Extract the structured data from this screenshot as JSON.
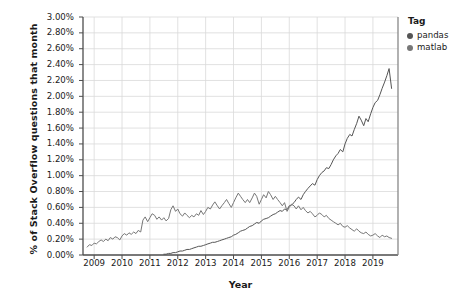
{
  "chart_data": {
    "type": "line",
    "title": "",
    "xlabel": "Year",
    "ylabel": "% of Stack Overflow questions that month",
    "xlim": [
      2008.6,
      2019.9
    ],
    "ylim": [
      0,
      3.0
    ],
    "grid": true,
    "legend_position": "right",
    "legend_title": "Tag",
    "y_tick_labels": [
      "0.00%",
      "0.20%",
      "0.40%",
      "0.60%",
      "0.80%",
      "1.00%",
      "1.20%",
      "1.40%",
      "1.60%",
      "1.80%",
      "2.00%",
      "2.20%",
      "2.40%",
      "2.60%",
      "2.80%",
      "3.00%"
    ],
    "y_tick_values": [
      0.0,
      0.2,
      0.4,
      0.6,
      0.8,
      1.0,
      1.2,
      1.4,
      1.6,
      1.8,
      2.0,
      2.2,
      2.4,
      2.6,
      2.8,
      3.0
    ],
    "x_tick_labels": [
      "2009",
      "2010",
      "2011",
      "2012",
      "2013",
      "2014",
      "2015",
      "2016",
      "2017",
      "2018",
      "2019"
    ],
    "x_tick_values": [
      2009,
      2010,
      2011,
      2012,
      2013,
      2014,
      2015,
      2016,
      2017,
      2018,
      2019
    ],
    "colors": {
      "pandas": "#555555",
      "matlab": "#777777",
      "grid": "#d9d9d9",
      "axis": "#4d4d4d"
    },
    "series": [
      {
        "name": "pandas",
        "color": "#555555",
        "x": [
          2011.5,
          2011.58,
          2011.67,
          2011.75,
          2011.83,
          2011.92,
          2012.0,
          2012.08,
          2012.17,
          2012.25,
          2012.33,
          2012.42,
          2012.5,
          2012.58,
          2012.67,
          2012.75,
          2012.83,
          2012.92,
          2013.0,
          2013.08,
          2013.17,
          2013.25,
          2013.33,
          2013.42,
          2013.5,
          2013.58,
          2013.67,
          2013.75,
          2013.83,
          2013.92,
          2014.0,
          2014.08,
          2014.17,
          2014.25,
          2014.33,
          2014.42,
          2014.5,
          2014.58,
          2014.67,
          2014.75,
          2014.83,
          2014.92,
          2015.0,
          2015.08,
          2015.17,
          2015.25,
          2015.33,
          2015.42,
          2015.5,
          2015.58,
          2015.67,
          2015.75,
          2015.83,
          2015.92,
          2016.0,
          2016.08,
          2016.17,
          2016.25,
          2016.33,
          2016.42,
          2016.5,
          2016.58,
          2016.67,
          2016.75,
          2016.83,
          2016.92,
          2017.0,
          2017.08,
          2017.17,
          2017.25,
          2017.33,
          2017.42,
          2017.5,
          2017.58,
          2017.67,
          2017.75,
          2017.83,
          2017.92,
          2018.0,
          2018.08,
          2018.17,
          2018.25,
          2018.33,
          2018.42,
          2018.5,
          2018.58,
          2018.67,
          2018.75,
          2018.83,
          2018.92,
          2019.0,
          2019.08,
          2019.17,
          2019.25,
          2019.33,
          2019.42,
          2019.5,
          2019.58,
          2019.67
        ],
        "y": [
          0.01,
          0.01,
          0.02,
          0.02,
          0.03,
          0.03,
          0.04,
          0.05,
          0.05,
          0.06,
          0.07,
          0.07,
          0.08,
          0.09,
          0.1,
          0.11,
          0.11,
          0.12,
          0.13,
          0.14,
          0.15,
          0.16,
          0.16,
          0.17,
          0.18,
          0.19,
          0.2,
          0.21,
          0.22,
          0.23,
          0.25,
          0.26,
          0.28,
          0.3,
          0.31,
          0.32,
          0.34,
          0.36,
          0.37,
          0.39,
          0.41,
          0.4,
          0.43,
          0.45,
          0.46,
          0.47,
          0.49,
          0.51,
          0.52,
          0.54,
          0.56,
          0.55,
          0.58,
          0.57,
          0.62,
          0.63,
          0.66,
          0.7,
          0.73,
          0.7,
          0.76,
          0.8,
          0.84,
          0.87,
          0.9,
          0.88,
          0.95,
          1.0,
          1.04,
          1.06,
          1.1,
          1.09,
          1.14,
          1.2,
          1.25,
          1.28,
          1.33,
          1.3,
          1.4,
          1.47,
          1.52,
          1.5,
          1.58,
          1.66,
          1.75,
          1.7,
          1.63,
          1.72,
          1.68,
          1.78,
          1.86,
          1.92,
          1.95,
          2.02,
          2.1,
          2.18,
          2.26,
          2.35,
          2.1
        ]
      },
      {
        "name": "matlab",
        "color": "#777777",
        "x": [
          2008.75,
          2008.83,
          2008.92,
          2009.0,
          2009.08,
          2009.17,
          2009.25,
          2009.33,
          2009.42,
          2009.5,
          2009.58,
          2009.67,
          2009.75,
          2009.83,
          2009.92,
          2010.0,
          2010.08,
          2010.17,
          2010.25,
          2010.33,
          2010.42,
          2010.5,
          2010.58,
          2010.67,
          2010.75,
          2010.83,
          2010.92,
          2011.0,
          2011.08,
          2011.17,
          2011.25,
          2011.33,
          2011.42,
          2011.5,
          2011.58,
          2011.67,
          2011.75,
          2011.83,
          2011.92,
          2012.0,
          2012.08,
          2012.17,
          2012.25,
          2012.33,
          2012.42,
          2012.5,
          2012.58,
          2012.67,
          2012.75,
          2012.83,
          2012.92,
          2013.0,
          2013.08,
          2013.17,
          2013.25,
          2013.33,
          2013.42,
          2013.5,
          2013.58,
          2013.67,
          2013.75,
          2013.83,
          2013.92,
          2014.0,
          2014.08,
          2014.17,
          2014.25,
          2014.33,
          2014.42,
          2014.5,
          2014.58,
          2014.67,
          2014.75,
          2014.83,
          2014.92,
          2015.0,
          2015.08,
          2015.17,
          2015.25,
          2015.33,
          2015.42,
          2015.5,
          2015.58,
          2015.67,
          2015.75,
          2015.83,
          2015.92,
          2016.0,
          2016.08,
          2016.17,
          2016.25,
          2016.33,
          2016.42,
          2016.5,
          2016.58,
          2016.67,
          2016.75,
          2016.83,
          2016.92,
          2017.0,
          2017.08,
          2017.17,
          2017.25,
          2017.33,
          2017.42,
          2017.5,
          2017.58,
          2017.67,
          2017.75,
          2017.83,
          2017.92,
          2018.0,
          2018.08,
          2018.17,
          2018.25,
          2018.33,
          2018.42,
          2018.5,
          2018.58,
          2018.67,
          2018.75,
          2018.83,
          2018.92,
          2019.0,
          2019.08,
          2019.17,
          2019.25,
          2019.33,
          2019.42,
          2019.5,
          2019.58,
          2019.67
        ],
        "y": [
          0.1,
          0.13,
          0.12,
          0.15,
          0.14,
          0.17,
          0.19,
          0.17,
          0.2,
          0.18,
          0.22,
          0.2,
          0.23,
          0.22,
          0.19,
          0.24,
          0.27,
          0.25,
          0.28,
          0.26,
          0.29,
          0.27,
          0.31,
          0.29,
          0.44,
          0.48,
          0.42,
          0.47,
          0.52,
          0.5,
          0.45,
          0.48,
          0.44,
          0.47,
          0.43,
          0.46,
          0.57,
          0.62,
          0.55,
          0.58,
          0.52,
          0.49,
          0.53,
          0.5,
          0.47,
          0.5,
          0.48,
          0.52,
          0.5,
          0.56,
          0.51,
          0.55,
          0.6,
          0.58,
          0.63,
          0.67,
          0.62,
          0.58,
          0.62,
          0.66,
          0.7,
          0.65,
          0.6,
          0.66,
          0.72,
          0.78,
          0.74,
          0.7,
          0.66,
          0.7,
          0.66,
          0.72,
          0.78,
          0.74,
          0.64,
          0.7,
          0.76,
          0.72,
          0.8,
          0.76,
          0.7,
          0.74,
          0.7,
          0.66,
          0.62,
          0.66,
          0.55,
          0.6,
          0.64,
          0.62,
          0.58,
          0.62,
          0.57,
          0.6,
          0.56,
          0.53,
          0.55,
          0.52,
          0.48,
          0.5,
          0.53,
          0.51,
          0.48,
          0.5,
          0.46,
          0.44,
          0.42,
          0.4,
          0.38,
          0.4,
          0.36,
          0.35,
          0.37,
          0.34,
          0.32,
          0.3,
          0.33,
          0.3,
          0.28,
          0.27,
          0.29,
          0.26,
          0.24,
          0.25,
          0.27,
          0.24,
          0.22,
          0.25,
          0.23,
          0.24,
          0.22,
          0.21
        ]
      }
    ]
  },
  "legend": {
    "title": "Tag",
    "items": [
      {
        "label": "pandas",
        "color": "#555555"
      },
      {
        "label": "matlab",
        "color": "#777777"
      }
    ]
  },
  "axes": {
    "x_title": "Year",
    "y_title": "% of Stack Overflow questions that month"
  }
}
